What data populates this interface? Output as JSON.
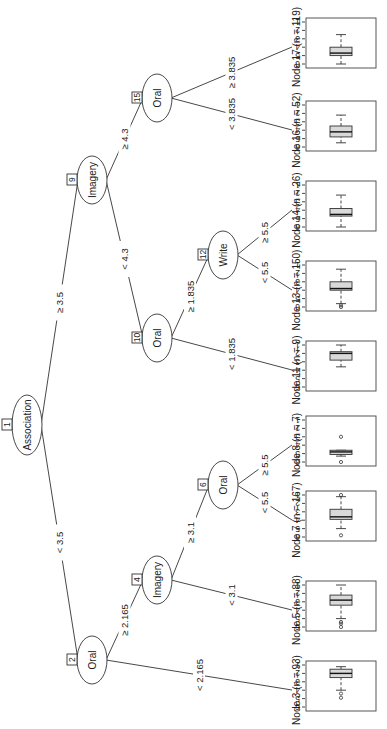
{
  "figure": {
    "type": "conditional inference tree (rotated page)",
    "rotation_deg": -90
  },
  "inner_nodes": [
    {
      "id": "1",
      "variable": "Association"
    },
    {
      "id": "2",
      "variable": "Oral"
    },
    {
      "id": "4",
      "variable": "Imagery"
    },
    {
      "id": "6",
      "variable": "Oral"
    },
    {
      "id": "9",
      "variable": "Imagery"
    },
    {
      "id": "10",
      "variable": "Oral"
    },
    {
      "id": "12",
      "variable": "Write"
    },
    {
      "id": "15",
      "variable": "Oral"
    }
  ],
  "edges": [
    {
      "from": "1",
      "to": "2",
      "label": "< 3.5"
    },
    {
      "from": "1",
      "to": "9",
      "label": "≥ 3.5"
    },
    {
      "from": "2",
      "to": "3",
      "label": "< 2.165"
    },
    {
      "from": "2",
      "to": "4",
      "label": "≥ 2.165"
    },
    {
      "from": "4",
      "to": "5",
      "label": "< 3.1"
    },
    {
      "from": "4",
      "to": "6",
      "label": "≥ 3.1"
    },
    {
      "from": "6",
      "to": "7",
      "label": "< 5.5"
    },
    {
      "from": "6",
      "to": "8",
      "label": "≥ 5.5"
    },
    {
      "from": "9",
      "to": "10",
      "label": "< 4.3"
    },
    {
      "from": "9",
      "to": "15",
      "label": "≥ 4.3"
    },
    {
      "from": "10",
      "to": "11",
      "label": "< 1.835"
    },
    {
      "from": "10",
      "to": "12",
      "label": "≥ 1.835"
    },
    {
      "from": "12",
      "to": "13",
      "label": "< 5.5"
    },
    {
      "from": "12",
      "to": "14",
      "label": "≥ 5.5"
    },
    {
      "from": "15",
      "to": "16",
      "label": "< 3.835"
    },
    {
      "from": "15",
      "to": "17",
      "label": "≥ 3.835"
    }
  ],
  "terminal_nodes": [
    {
      "id": "3",
      "label": "Node 3 (n = 93)",
      "n": 93,
      "box": {
        "wlo": 1.2,
        "q1": 1.5,
        "med": 2.0,
        "q3": 2.5,
        "whi": 4.0
      },
      "outliers": [
        4.4,
        4.9
      ]
    },
    {
      "id": "5",
      "label": "Node 5 (n = 88)",
      "n": 88,
      "box": {
        "wlo": 1.0,
        "q1": 2.2,
        "med": 2.8,
        "q3": 3.4,
        "whi": 5.0
      },
      "outliers": [
        5.4,
        5.6,
        6.0
      ]
    },
    {
      "id": "7",
      "label": "Node 7 (n = 167)",
      "n": 167,
      "box": {
        "wlo": 1.2,
        "q1": 2.7,
        "med": 3.6,
        "q3": 3.9,
        "whi": 5.0
      },
      "outliers": [
        1.0,
        5.8
      ]
    },
    {
      "id": "8",
      "label": "Node 8 (n = 7)",
      "n": 7,
      "box": {
        "wlo": 4.6,
        "q1": 4.6,
        "med": 4.8,
        "q3": 5.1,
        "whi": 5.3
      },
      "outliers": [
        6.0,
        3.0
      ]
    },
    {
      "id": "11",
      "label": "Node 11 (n = 9)",
      "n": 9,
      "box": {
        "wlo": 1.0,
        "q1": 1.8,
        "med": 2.0,
        "q3": 2.8,
        "whi": 3.6
      },
      "outliers": []
    },
    {
      "id": "13",
      "label": "Node 13 (n = 150)",
      "n": 150,
      "box": {
        "wlo": 1.5,
        "q1": 3.0,
        "med": 3.8,
        "q3": 4.0,
        "whi": 5.6
      },
      "outliers": [
        5.8,
        6.0
      ]
    },
    {
      "id": "14",
      "label": "Node 14 (n = 26)",
      "n": 26,
      "box": {
        "wlo": 2.2,
        "q1": 3.8,
        "med": 4.5,
        "q3": 4.7,
        "whi": 6.0
      },
      "outliers": []
    },
    {
      "id": "16",
      "label": "Node 16 (n = 52)",
      "n": 52,
      "box": {
        "wlo": 2.2,
        "q1": 3.5,
        "med": 4.2,
        "q3": 4.8,
        "whi": 5.5
      },
      "outliers": []
    },
    {
      "id": "17",
      "label": "Node 17 (n = 119)",
      "n": 119,
      "box": {
        "wlo": 2.5,
        "q1": 4.0,
        "med": 4.7,
        "q3": 5.0,
        "whi": 6.0
      },
      "outliers": []
    }
  ],
  "axis": {
    "ticks": [
      "6",
      "5",
      "4",
      "3",
      "2",
      "1"
    ],
    "range": [
      1,
      6
    ]
  },
  "caption": "Figure: Conditional inference tree"
}
